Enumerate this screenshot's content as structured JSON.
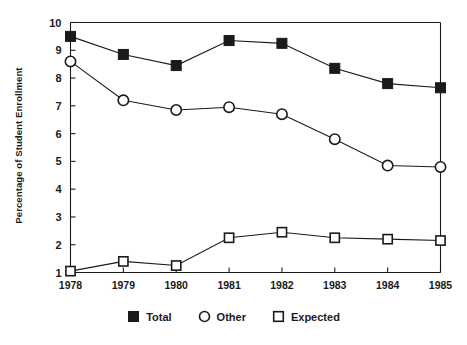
{
  "chart_data": {
    "type": "line",
    "title": "",
    "subtitle": "",
    "xlabel": "",
    "ylabel": "Percentage of Student Enrollment",
    "categories": [
      "1978",
      "1979",
      "1980",
      "1981",
      "1982",
      "1983",
      "1984",
      "1985"
    ],
    "x": [
      1978,
      1979,
      1980,
      1981,
      1982,
      1983,
      1984,
      1985
    ],
    "xlim": [
      1978,
      1985
    ],
    "ylim": [
      1,
      10
    ],
    "ytick_labels": [
      "1",
      "2",
      "3",
      "4",
      "5",
      "6",
      "7",
      "8",
      "9",
      "10"
    ],
    "yticks": [
      1,
      2,
      3,
      4,
      5,
      6,
      7,
      8,
      9,
      10
    ],
    "grid": false,
    "legend_position": "bottom",
    "series": [
      {
        "name": "Total",
        "marker": "filled-square",
        "values": [
          9.5,
          8.85,
          8.45,
          9.35,
          9.25,
          8.35,
          7.8,
          7.65
        ]
      },
      {
        "name": "Other",
        "marker": "open-circle",
        "values": [
          8.6,
          7.2,
          6.85,
          6.95,
          6.7,
          5.8,
          4.85,
          4.8
        ]
      },
      {
        "name": "Expected",
        "marker": "open-square",
        "values": [
          1.05,
          1.4,
          1.25,
          2.25,
          2.45,
          2.25,
          2.2,
          2.15
        ]
      }
    ]
  },
  "legend": {
    "items": [
      {
        "label": "Total",
        "marker": "filled-square"
      },
      {
        "label": "Other",
        "marker": "open-circle"
      },
      {
        "label": "Expected",
        "marker": "open-square"
      }
    ]
  }
}
